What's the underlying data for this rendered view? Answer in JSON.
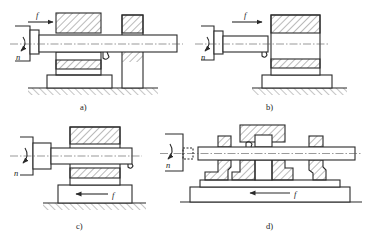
{
  "figure": {
    "panels": [
      {
        "id": "a",
        "label": "a)",
        "rotation_symbol": "n",
        "feed_symbol": "f",
        "feed_direction": "right",
        "support": "rear support bracket"
      },
      {
        "id": "b",
        "label": "b)",
        "rotation_symbol": "n",
        "feed_symbol": "f",
        "feed_direction": "right",
        "support": "cantilever bar"
      },
      {
        "id": "c",
        "label": "c)",
        "rotation_symbol": "n",
        "feed_symbol": "f",
        "feed_direction": "left",
        "support": "cantilever bar, table feed"
      },
      {
        "id": "d",
        "label": "d)",
        "rotation_symbol": "n",
        "feed_symbol": "f",
        "feed_direction": "left",
        "support": "two guide bushings, table feed"
      }
    ]
  },
  "colors": {
    "line": "#2a2a2a",
    "background": "#ffffff"
  }
}
